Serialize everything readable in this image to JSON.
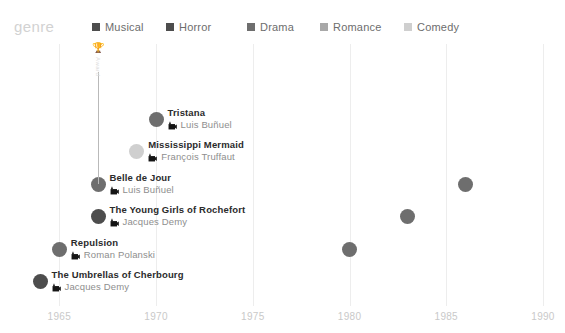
{
  "legend": {
    "title": "genre",
    "items": [
      {
        "label": "Musical",
        "color": "#4d4d4d"
      },
      {
        "label": "Horror",
        "color": "#4d4d4d"
      },
      {
        "label": "Drama",
        "color": "#6e6e6e"
      },
      {
        "label": "Romance",
        "color": "#a8a8a8"
      },
      {
        "label": "Comedy",
        "color": "#cfcfcf"
      }
    ]
  },
  "award": {
    "icon": "trophy-icon",
    "label": "Award"
  },
  "chart_data": {
    "type": "scatter",
    "title": "genre",
    "xlabel": "",
    "ylabel": "",
    "xlim": [
      1964,
      1990.5
    ],
    "grid": true,
    "legend_position": "top",
    "tick_labels": [
      "1965",
      "1970",
      "1975",
      "1980",
      "1985",
      "1990"
    ],
    "tick_values": [
      1965,
      1970,
      1975,
      1980,
      1985,
      1990
    ],
    "points": [
      {
        "title": "Tristana",
        "director": "Luis Buñuel",
        "year": 1970,
        "y": 75,
        "color": "#6e6e6e",
        "size": 15,
        "side": "right"
      },
      {
        "title": "Mississippi Mermaid",
        "director": "François Truffaut",
        "year": 1969,
        "y": 107,
        "color": "#cfcfcf",
        "size": 15,
        "side": "right"
      },
      {
        "title": "Belle de Jour",
        "director": "Luis Buñuel",
        "year": 1967,
        "y": 140,
        "color": "#6e6e6e",
        "size": 15,
        "side": "right",
        "award": true
      },
      {
        "title": "The Young Girls of Rochefort",
        "director": "Jacques Demy",
        "year": 1967,
        "y": 172,
        "color": "#4d4d4d",
        "size": 15,
        "side": "right"
      },
      {
        "title": "Repulsion",
        "director": "Roman Polanski",
        "year": 1965,
        "y": 205,
        "color": "#6e6e6e",
        "size": 15,
        "side": "right"
      },
      {
        "title": "The Umbrellas of Cherbourg",
        "director": "Jacques Demy",
        "year": 1964,
        "y": 237,
        "color": "#4d4d4d",
        "size": 15,
        "side": "right"
      },
      {
        "title": "Scene of the Crime",
        "director": "André Téchiné",
        "year": 1986,
        "y": 140,
        "color": "#6e6e6e",
        "size": 15,
        "side": "left"
      },
      {
        "title": "The Hunger",
        "director": "Tony Scott",
        "year": 1983,
        "y": 172,
        "color": "#6e6e6e",
        "size": 15,
        "side": "left"
      },
      {
        "title": "The Last Metro",
        "director": "François Truffaut",
        "year": 1980,
        "y": 205,
        "color": "#6e6e6e",
        "size": 15,
        "side": "left"
      }
    ]
  }
}
